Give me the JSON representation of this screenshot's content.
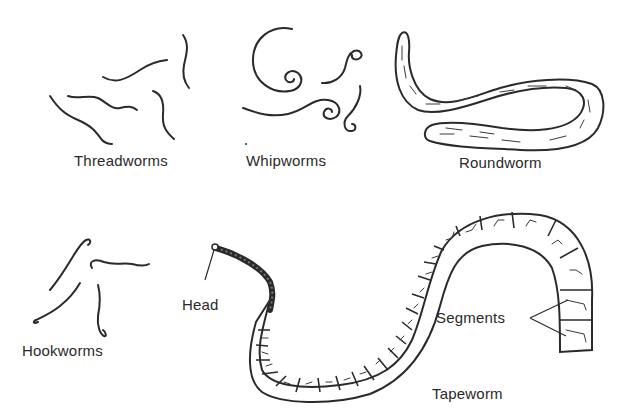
{
  "diagram": {
    "groups": [
      {
        "id": "threadworms",
        "label": "Threadworms"
      },
      {
        "id": "whipworms",
        "label": "Whipworms"
      },
      {
        "id": "roundworm",
        "label": "Roundworm"
      },
      {
        "id": "hookworms",
        "label": "Hookworms"
      },
      {
        "id": "tapeworm",
        "label": "Tapeworm"
      }
    ],
    "annotations": {
      "head": "Head",
      "segments": "Segments"
    },
    "colors": {
      "ink": "#2a2a2a",
      "background": "#ffffff"
    }
  }
}
